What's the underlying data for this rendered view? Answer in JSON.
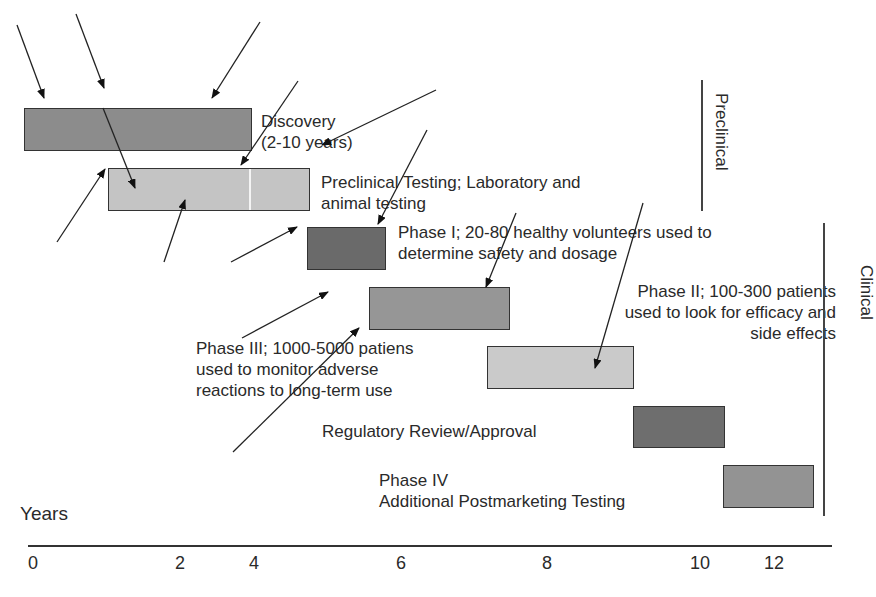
{
  "diagram": {
    "type": "gantt-timeline",
    "axis": {
      "label": "Years",
      "ticks": [
        "0",
        "2",
        "4",
        "6",
        "8",
        "10",
        "12"
      ]
    },
    "stages": [
      {
        "id": "discovery",
        "lines": [
          "Discovery",
          "(2-10 years)"
        ],
        "color": "#8c8c8c"
      },
      {
        "id": "preclinical",
        "lines": [
          "Preclinical Testing; Laboratory and",
          "animal testing"
        ],
        "color": "#c4c4c4"
      },
      {
        "id": "phase1",
        "lines": [
          "Phase I; 20-80 healthy volunteers used to",
          "determine safety and dosage"
        ],
        "color": "#6a6a6a"
      },
      {
        "id": "phase2",
        "lines": [
          "Phase II; 100-300 patients",
          "used to look for efficacy and",
          "side effects"
        ],
        "color": "#969696"
      },
      {
        "id": "phase3",
        "lines": [
          "Phase III; 1000-5000 patiens",
          "used to monitor adverse",
          "reactions to long-term use"
        ],
        "color": "#cacaca"
      },
      {
        "id": "review",
        "lines": [
          "Regulatory Review/Approval"
        ],
        "color": "#6e6e6e"
      },
      {
        "id": "phase4",
        "lines": [
          "Phase IV",
          "Additional Postmarketing Testing"
        ],
        "color": "#939393"
      }
    ],
    "groups": [
      {
        "label": "Preclinical"
      },
      {
        "label": "Clinical"
      }
    ]
  }
}
